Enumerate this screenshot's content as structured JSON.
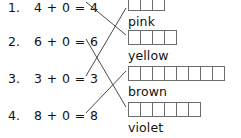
{
  "worksheet": {
    "type": "matching-exercise",
    "instruction_visible": false,
    "equations": [
      {
        "index": "1.",
        "text": "4 + 0 = 4",
        "addend_a": 4,
        "addend_b": 0,
        "sum": 4,
        "top": -1
      },
      {
        "index": "2.",
        "text": "6 + 0 = 6",
        "addend_a": 6,
        "addend_b": 0,
        "sum": 6,
        "top": 33
      },
      {
        "index": "3.",
        "text": "3 + 0 = 3",
        "addend_a": 3,
        "addend_b": 0,
        "sum": 3,
        "top": 70
      },
      {
        "index": "4.",
        "text": "8 + 0 = 8",
        "addend_a": 8,
        "addend_b": 0,
        "sum": 8,
        "top": 107
      }
    ],
    "color_groups": [
      {
        "label": "pink",
        "boxes": 3,
        "strip_top": -4,
        "label_top": 14,
        "clipped_top": true
      },
      {
        "label": "yellow",
        "boxes": 4,
        "strip_top": 30,
        "label_top": 48,
        "clipped_top": false
      },
      {
        "label": "brown",
        "boxes": 8,
        "strip_top": 66,
        "label_top": 84,
        "clipped_top": false
      },
      {
        "label": "violet",
        "boxes": 6,
        "strip_top": 102,
        "label_top": 120,
        "clipped_top": false
      }
    ],
    "connections": [
      {
        "from_equation": 0,
        "to_color": "yellow",
        "x1": 86,
        "y1": 2,
        "x2": 126,
        "y2": 35
      },
      {
        "from_equation": 1,
        "to_color": "violet",
        "x1": 86,
        "y1": 39,
        "x2": 126,
        "y2": 107
      },
      {
        "from_equation": 2,
        "to_color": "pink",
        "x1": 86,
        "y1": 76,
        "x2": 126,
        "y2": 8
      },
      {
        "from_equation": 3,
        "to_color": "brown",
        "x1": 86,
        "y1": 113,
        "x2": 126,
        "y2": 71
      }
    ],
    "colors": {
      "text": "#111111",
      "box_border": "#6d6d6d",
      "connector_line": "#4a4a4a",
      "background": "#ffffff"
    }
  }
}
